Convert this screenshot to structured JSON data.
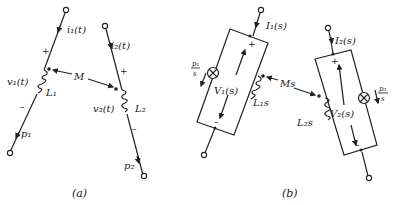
{
  "figure_a": {
    "caption": "(a)",
    "current1": "i₁(t)",
    "current2": "i₂(t)",
    "voltage1": "v₁(t)",
    "voltage2": "v₂(t)",
    "inductor1": "L₁",
    "inductor2": "L₂",
    "mutual": "M",
    "initial1": "p₁",
    "initial2": "p₂",
    "plus": "+",
    "minus": "–"
  },
  "figure_b": {
    "caption": "(b)",
    "current1": "I₁(s)",
    "current2": "I₂(s)",
    "voltage1": "V₁(s)",
    "voltage2": "V₂(s)",
    "inductor1": "L₁s",
    "inductor2": "L₂s",
    "mutual": "Ms",
    "source1_num": "p₁",
    "source1_den": "s",
    "source2_num": "p₂",
    "source2_den": "s",
    "plus": "+",
    "minus": "–"
  },
  "icons": {
    "terminal": "open-circle",
    "current-source": "circle-with-x",
    "inductor": "coil",
    "dot": "polarity-dot"
  }
}
